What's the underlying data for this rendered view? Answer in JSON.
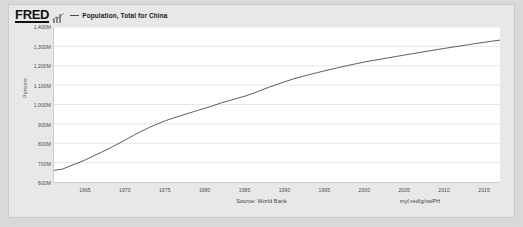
{
  "window": {
    "frame_color": "#d9d9d9",
    "card_background": "#e8e8e8",
    "plot_background": "#ffffff"
  },
  "header": {
    "logo_text": "FRED",
    "logo_icon": "bar-chart-icon",
    "legend": [
      {
        "marker": "line",
        "color": "#4a4a4a",
        "label": "Population, Total for China"
      }
    ]
  },
  "footer": {
    "source_text": "Source: World Bank",
    "short_url": "myf.red/g/xwPH"
  },
  "chart_data": {
    "type": "line",
    "title": "Population, Total for China",
    "xlabel": "",
    "ylabel": "Persons",
    "grid": true,
    "legend_position": "top-left",
    "xlim": [
      1961,
      2017
    ],
    "ylim": [
      600000000,
      1400000000
    ],
    "ytick_values": [
      600000000,
      700000000,
      800000000,
      900000000,
      1000000000,
      1100000000,
      1200000000,
      1300000000,
      1400000000
    ],
    "ytick_labels": [
      "600M",
      "700M",
      "800M",
      "900M",
      "1,000M",
      "1,100M",
      "1,200M",
      "1,300M",
      "1,400M"
    ],
    "xtick_values": [
      1965,
      1970,
      1975,
      1980,
      1985,
      1990,
      1995,
      2000,
      2005,
      2010,
      2015
    ],
    "xtick_labels": [
      "1965",
      "1970",
      "1975",
      "1980",
      "1985",
      "1990",
      "1995",
      "2000",
      "2005",
      "2010",
      "2015"
    ],
    "series": [
      {
        "name": "Population, Total for China",
        "color": "#4a4a4a",
        "x": [
          1961,
          1962,
          1963,
          1964,
          1965,
          1966,
          1967,
          1968,
          1969,
          1970,
          1971,
          1972,
          1973,
          1974,
          1975,
          1976,
          1977,
          1978,
          1979,
          1980,
          1981,
          1982,
          1983,
          1984,
          1985,
          1986,
          1987,
          1988,
          1989,
          1990,
          1991,
          1992,
          1993,
          1994,
          1995,
          1996,
          1997,
          1998,
          1999,
          2000,
          2001,
          2002,
          2003,
          2004,
          2005,
          2006,
          2007,
          2008,
          2009,
          2010,
          2011,
          2012,
          2013,
          2014,
          2015,
          2016,
          2017
        ],
        "y": [
          660330000,
          665770000,
          682335000,
          698355000,
          715185000,
          735400000,
          754550000,
          774510000,
          796025000,
          818315000,
          841105000,
          862030000,
          881940000,
          900350000,
          916395000,
          930685000,
          943455000,
          956165000,
          969005000,
          981235000,
          993885000,
          1008630000,
          1020090000,
          1031880000,
          1043570000,
          1057450000,
          1073570000,
          1089230000,
          1103430000,
          1117570000,
          1131250000,
          1142670000,
          1153570000,
          1163950000,
          1173950000,
          1183650000,
          1193040000,
          1202280000,
          1211140000,
          1219330000,
          1226930000,
          1234120000,
          1241170000,
          1248230000,
          1255230000,
          1262170000,
          1269070000,
          1275920000,
          1282700000,
          1289380000,
          1295880000,
          1302280000,
          1308570000,
          1314800000,
          1320970000,
          1326860000,
          1332370000
        ]
      }
    ]
  }
}
